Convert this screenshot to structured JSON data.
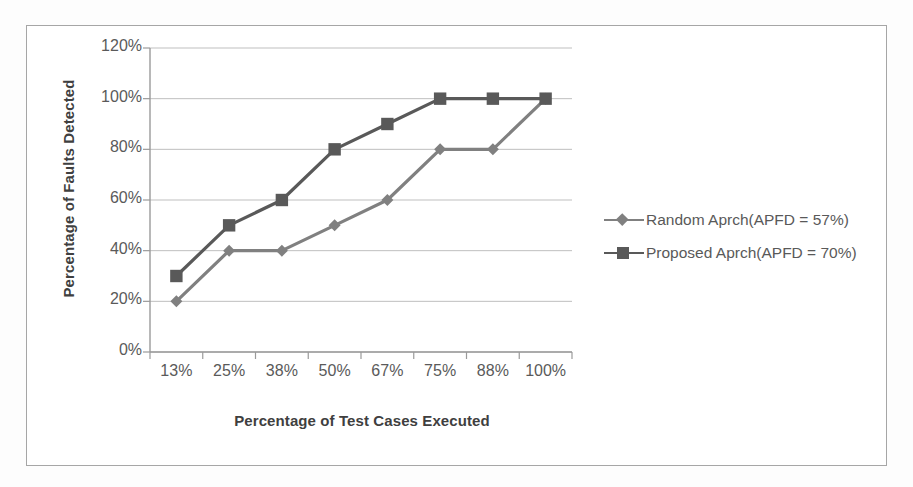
{
  "chart_data": {
    "type": "line",
    "title": "",
    "xlabel": "Percentage of Test Cases Executed",
    "ylabel": "Percentage of Faults Detected",
    "categories": [
      "13%",
      "25%",
      "38%",
      "50%",
      "67%",
      "75%",
      "88%",
      "100%"
    ],
    "ytick_labels": [
      "0%",
      "20%",
      "40%",
      "60%",
      "80%",
      "100%",
      "120%"
    ],
    "ytick_values": [
      0,
      20,
      40,
      60,
      80,
      100,
      120
    ],
    "ylim": [
      0,
      120
    ],
    "grid": true,
    "legend_position": "right",
    "series": [
      {
        "name": "Random Aprch(APFD = 57%)",
        "marker": "diamond",
        "color": "#808080",
        "values": [
          20,
          40,
          40,
          50,
          60,
          80,
          80,
          100
        ]
      },
      {
        "name": "Proposed Aprch(APFD = 70%)",
        "marker": "square",
        "color": "#595959",
        "values": [
          30,
          50,
          60,
          80,
          90,
          100,
          100,
          100
        ]
      }
    ]
  },
  "colors": {
    "frame_border": "#a6a6a6",
    "axis_line": "#9a9a9a",
    "gridline": "#bfbfbf",
    "tick_label": "#5a5a5a",
    "axis_title": "#3f3f3f",
    "series_random": "#808080",
    "series_proposed": "#595959",
    "background": "#ffffff"
  }
}
